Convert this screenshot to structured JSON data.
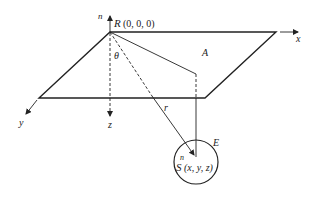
{
  "diagram": {
    "type": "geometry-3d-coordinate-system",
    "labels": {
      "normal_top": "n",
      "origin_point": "R",
      "origin_coords": "(0, 0, 0)",
      "x_axis": "x",
      "y_axis": "y",
      "z_axis": "z",
      "angle": "θ",
      "plane": "A",
      "distance": "r",
      "sphere": "E",
      "normal_bottom": "n",
      "target_point": "S",
      "target_coords": "(x, y, z)"
    },
    "colors": {
      "line": "#222222",
      "background": "#ffffff"
    }
  }
}
